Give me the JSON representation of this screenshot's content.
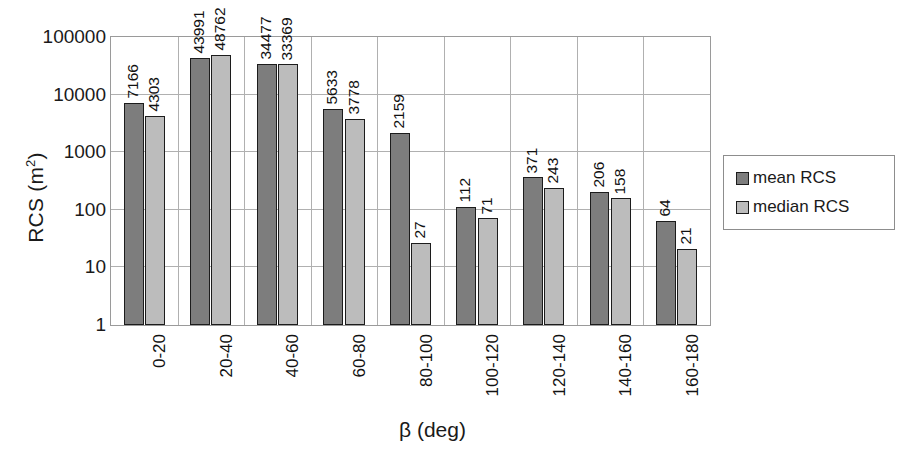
{
  "chart_data": {
    "type": "bar",
    "title": "",
    "xlabel": "β (deg)",
    "ylabel": "RCS (m2)",
    "ylabel_base": "RCS (m",
    "ylabel_sup": "2",
    "ylabel_tail": ")",
    "yscale": "log",
    "ylim": [
      1,
      100000
    ],
    "grid": true,
    "legend_position": "right",
    "categories": [
      "0-20",
      "20-40",
      "40-60",
      "60-80",
      "80-100",
      "100-120",
      "120-140",
      "140-160",
      "160-180"
    ],
    "y_ticks": [
      "100000",
      "10000",
      "1000",
      "100",
      "10",
      "1"
    ],
    "y_tick_values": [
      100000,
      10000,
      1000,
      100,
      10,
      1
    ],
    "series": [
      {
        "name": "mean RCS",
        "color": "#7d7d7d",
        "values": [
          7166,
          43991,
          34477,
          5633,
          2159,
          112,
          371,
          206,
          64
        ],
        "labels": [
          "7166",
          "43991",
          "34477",
          "5633",
          "2159",
          "112",
          "371",
          "206",
          "64"
        ]
      },
      {
        "name": "median RCS",
        "color": "#bcbcbc",
        "values": [
          4303,
          48762,
          33369,
          3778,
          27,
          71,
          243,
          158,
          21
        ],
        "labels": [
          "4303",
          "48762",
          "33369",
          "3778",
          "27",
          "71",
          "243",
          "158",
          "21"
        ]
      }
    ]
  },
  "legend": {
    "items": [
      {
        "label": "mean RCS",
        "color": "#7d7d7d"
      },
      {
        "label": "median RCS",
        "color": "#bcbcbc"
      }
    ]
  },
  "colors": {
    "mean": "#7d7d7d",
    "median": "#bcbcbc",
    "gridline": "#b0b0b0",
    "axis": "#9a9a9a",
    "text": "#1a1a1a",
    "background": "#ffffff"
  }
}
